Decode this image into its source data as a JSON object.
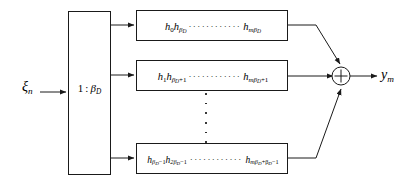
{
  "figure": {
    "type": "block-diagram"
  },
  "input": {
    "symbol": "xi",
    "base": "ξ",
    "subscript": "n",
    "label": "ξ_n"
  },
  "splitter": {
    "name": "serial-to-parallel-splitter",
    "ratio_left": "1",
    "separator": ":",
    "ratio_right_base": "β",
    "ratio_right_sub": "D",
    "label": "1 : β_D"
  },
  "branches": [
    {
      "id": "top",
      "terms": [
        {
          "base": "h",
          "sub": "0"
        },
        {
          "base": "h",
          "sub": "β",
          "subsub": "D"
        }
      ],
      "ellipsis": "············",
      "last": {
        "base": "h",
        "sub": "mβ",
        "subsub": "D"
      },
      "label": "h_0 h_{β_D} ⋯ h_{mβ_D}"
    },
    {
      "id": "middle",
      "terms": [
        {
          "base": "h",
          "sub": "1"
        },
        {
          "base": "h",
          "sub": "β",
          "subsub": "D",
          "tail": "+1"
        }
      ],
      "ellipsis": "············",
      "last": {
        "base": "h",
        "sub": "mβ",
        "subsub": "D",
        "tail": "+1"
      },
      "label": "h_1 h_{β_D+1} ⋯ h_{mβ_D+1}"
    },
    {
      "id": "bottom",
      "terms": [
        {
          "base": "h",
          "sub": "β",
          "subsub": "D",
          "tail": "−1"
        },
        {
          "base": "h",
          "sub": "2β",
          "subsub": "D",
          "tail": "−1"
        }
      ],
      "ellipsis": "············",
      "last": {
        "base": "h",
        "sub": "mβ",
        "subsub": "D",
        "tail": "+β",
        "tailsub": "D",
        "tail2": "−1"
      },
      "label": "h_{β_D−1} h_{2β_D−1} ⋯ h_{mβ_D+β_D−1}"
    }
  ],
  "vertical_ellipsis": {
    "name": "vertical-ellipsis",
    "dot_count": 6
  },
  "adder": {
    "name": "summing-junction",
    "glyph": "⊕",
    "operation": "+"
  },
  "output": {
    "symbol": "y",
    "base": "y",
    "subscript": "m",
    "label": "y_m"
  },
  "colors": {
    "line": "#1a1a1a",
    "background": "#ffffff",
    "text": "#000000"
  }
}
